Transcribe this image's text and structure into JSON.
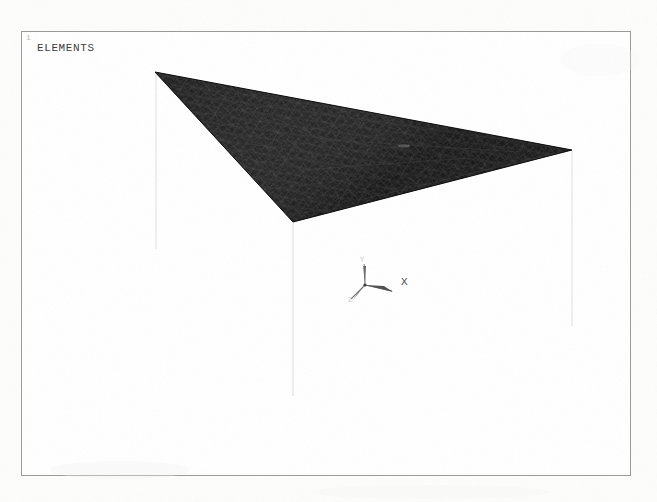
{
  "window": {
    "number": "1",
    "title": "ELEMENTS"
  },
  "plot": {
    "kind": "fea-element-mesh",
    "background_color": "#ffffff",
    "frame_color": "#9a9a9a",
    "mesh_fill_color": "#141414",
    "mesh_edge_color": "#2e2e2e",
    "projection_line_color": "#e2e2e2"
  },
  "triad": {
    "name": "coordinate-triad",
    "origin_x": 365,
    "origin_y": 285,
    "labels": {
      "x": "X",
      "y": "Y",
      "z": "Z"
    }
  },
  "geometry": {
    "description": "Triangular meshed surface shown in 3D oblique view",
    "vertices": [
      {
        "name": "left-vertex",
        "x": 155,
        "y": 72
      },
      {
        "name": "right-vertex",
        "x": 572,
        "y": 150
      },
      {
        "name": "front-vertex",
        "x": 293,
        "y": 222
      }
    ],
    "projection_lines": [
      {
        "name": "left-drop-line",
        "x": 156,
        "y1": 73,
        "y2": 249
      },
      {
        "name": "front-drop-line",
        "x": 293,
        "y1": 223,
        "y2": 396
      },
      {
        "name": "right-drop-line",
        "x": 572,
        "y1": 151,
        "y2": 326
      }
    ]
  }
}
